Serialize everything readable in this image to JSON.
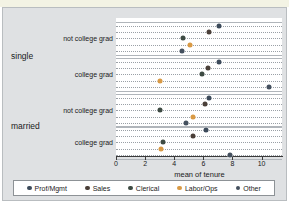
{
  "figure": {
    "title_fragment": "",
    "background_color": "#dfe1e3",
    "plot_background_color": "#ffffff"
  },
  "axis": {
    "xlabel": "mean of tenure",
    "xticks": [
      "0",
      "2",
      "4",
      "6",
      "8",
      "10"
    ],
    "xlim": [
      0,
      11.4
    ],
    "gridlines": "horizontal dotted"
  },
  "groups": [
    {
      "name": "single",
      "subgroups": [
        {
          "label": "not college grad"
        },
        {
          "label": "college grad"
        }
      ]
    },
    {
      "name": "married",
      "subgroups": [
        {
          "label": "not college grad"
        },
        {
          "label": "college grad"
        }
      ]
    }
  ],
  "legend": {
    "position": "bottom",
    "entries": [
      {
        "label": "Prof/Mgmt",
        "color": "#3c4a5a"
      },
      {
        "label": "Sales",
        "color": "#4a3f38"
      },
      {
        "label": "Clerical",
        "color": "#3d4a42"
      },
      {
        "label": "Labor/Ops",
        "color": "#d99a45"
      },
      {
        "label": "Other",
        "color": "#44505e"
      }
    ]
  },
  "chart_data": {
    "type": "scatter",
    "title": "",
    "xlabel": "mean of tenure",
    "ylabel": "",
    "xlim": [
      0,
      11.4
    ],
    "grid": true,
    "legend_position": "bottom",
    "categories": [
      "single / not college grad",
      "single / college grad",
      "married / not college grad",
      "married / college grad"
    ],
    "series": [
      {
        "name": "Prof/Mgmt",
        "color": "#3c4a5a",
        "values": [
          7.1,
          7.1,
          6.4,
          6.2
        ]
      },
      {
        "name": "Sales",
        "color": "#4a3f38",
        "values": [
          6.4,
          6.3,
          6.1,
          5.3
        ]
      },
      {
        "name": "Clerical",
        "color": "#3d4a42",
        "values": [
          4.6,
          5.9,
          3.0,
          3.2
        ]
      },
      {
        "name": "Labor/Ops",
        "color": "#d99a45",
        "values": [
          5.1,
          3.0,
          5.3,
          3.1
        ]
      },
      {
        "name": "Other",
        "color": "#44505e",
        "values": [
          4.5,
          10.5,
          4.8,
          7.8
        ]
      }
    ]
  }
}
